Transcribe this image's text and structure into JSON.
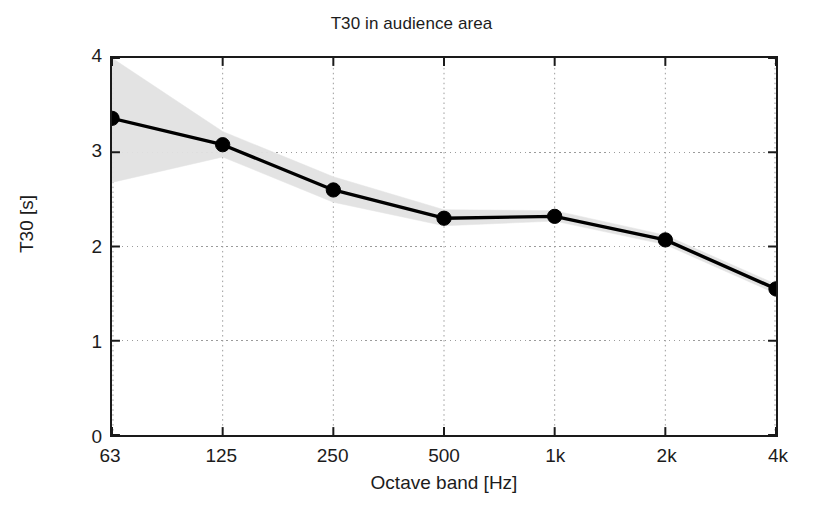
{
  "chart_data": {
    "type": "line",
    "title": "T30 in audience area",
    "xlabel": "Octave band [Hz]",
    "ylabel": "T30 [s]",
    "categories": [
      "63",
      "125",
      "250",
      "500",
      "1k",
      "2k",
      "4k"
    ],
    "x_values": [
      63,
      125,
      250,
      500,
      1000,
      2000,
      4000
    ],
    "ylim": [
      0,
      4
    ],
    "ytick_labels": [
      "0",
      "1",
      "2",
      "3",
      "4"
    ],
    "ytick_values": [
      0,
      1,
      2,
      3,
      4
    ],
    "grid": "dotted-gray",
    "legend": "none",
    "series": [
      {
        "name": "T30 mean",
        "marker": "filled-circle",
        "color": "#000000",
        "values": [
          3.36,
          3.08,
          2.6,
          2.3,
          2.32,
          2.07,
          1.55
        ]
      }
    ],
    "band": {
      "name": "spread (min-max)",
      "color": "#e2e2e2",
      "upper": [
        4.0,
        3.22,
        2.74,
        2.39,
        2.38,
        2.12,
        1.6
      ],
      "lower": [
        2.68,
        2.95,
        2.47,
        2.22,
        2.27,
        2.02,
        1.5
      ]
    }
  }
}
